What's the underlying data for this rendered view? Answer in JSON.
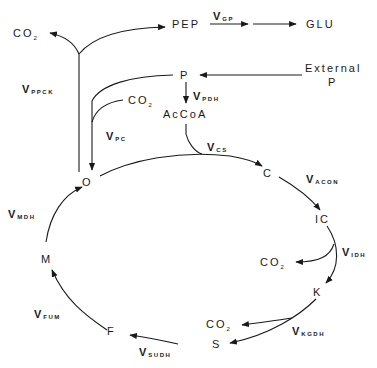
{
  "nodes": {
    "co2_top": {
      "label": "CO",
      "sub": "2"
    },
    "pep": {
      "label": "PEP"
    },
    "glu": {
      "label": "GLU"
    },
    "p": {
      "label": "P"
    },
    "external_p": {
      "line1": "External",
      "line2": "P"
    },
    "co2_pc": {
      "label": "CO",
      "sub": "2"
    },
    "accoa": {
      "label": "AcCoA"
    },
    "o": {
      "label": "O"
    },
    "c": {
      "label": "C"
    },
    "ic": {
      "label": "IC"
    },
    "co2_idh": {
      "label": "CO",
      "sub": "2"
    },
    "k": {
      "label": "K"
    },
    "co2_kgdh": {
      "label": "CO",
      "sub": "2"
    },
    "s": {
      "label": "S"
    },
    "f": {
      "label": "F"
    },
    "m": {
      "label": "M"
    }
  },
  "fluxes": {
    "gp": {
      "v": "V",
      "sub": "GP"
    },
    "ppck": {
      "v": "V",
      "sub": "PPCK"
    },
    "pdh": {
      "v": "V",
      "sub": "PDH"
    },
    "pc": {
      "v": "V",
      "sub": "PC"
    },
    "cs": {
      "v": "V",
      "sub": "CS"
    },
    "acon": {
      "v": "V",
      "sub": "ACON"
    },
    "idh": {
      "v": "V",
      "sub": "IDH"
    },
    "kgdh": {
      "v": "V",
      "sub": "KGDH"
    },
    "sudh": {
      "v": "V",
      "sub": "SUDH"
    },
    "fum": {
      "v": "V",
      "sub": "FUM"
    },
    "mdh": {
      "v": "V",
      "sub": "MDH"
    }
  },
  "colors": {
    "ink": "#1a1a1a",
    "background": "#ffffff"
  }
}
